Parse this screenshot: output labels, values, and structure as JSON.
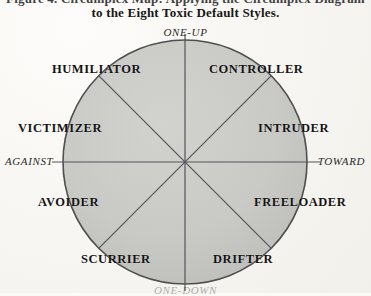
{
  "figure": {
    "caption": {
      "line1": "Figure 4. Circumplex Map: Applying the Circumplex Diagram",
      "line2": "to the Eight Toxic Default Styles."
    },
    "axes": {
      "top": "ONE-UP",
      "bottom": "ONE-DOWN",
      "left": "AGAINST",
      "right": "TOWARD"
    },
    "circle": {
      "fill_color": "#c9c9c6",
      "stroke_color": "#4a4a4a",
      "divider_color": "#55555a",
      "center_x": 185,
      "center_y": 162,
      "radius": 122,
      "sector_count": 8
    },
    "sectors": [
      {
        "label": "HUMILIATOR",
        "position": "upper-left"
      },
      {
        "label": "CONTROLLER",
        "position": "upper-right"
      },
      {
        "label": "VICTIMIZER",
        "position": "left-upper"
      },
      {
        "label": "INTRUDER",
        "position": "right-upper"
      },
      {
        "label": "AVOIDER",
        "position": "left-lower"
      },
      {
        "label": "FREELOADER",
        "position": "right-lower"
      },
      {
        "label": "SCURRIER",
        "position": "lower-left"
      },
      {
        "label": "DRIFTER",
        "position": "lower-right"
      }
    ]
  }
}
